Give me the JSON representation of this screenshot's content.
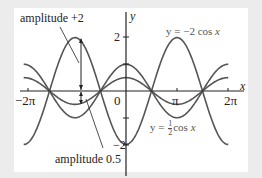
{
  "chart_data": {
    "type": "line",
    "title": "",
    "xlabel": "x",
    "ylabel": "y",
    "xlim": [
      -6.6,
      6.8
    ],
    "ylim": [
      -2.6,
      3.0
    ],
    "x_ticks": [
      "-2π",
      "0",
      "π",
      "2π"
    ],
    "y_ticks": [
      "2",
      "-2"
    ],
    "grid": false,
    "series": [
      {
        "name": "y = -2 cos x",
        "function": "-2*cos(x)",
        "amplitude": 2,
        "domain": [
          -6.3,
          6.3
        ]
      },
      {
        "name": "y = cos x",
        "function": "cos(x)",
        "amplitude": 1,
        "domain": [
          -6.3,
          6.3
        ]
      },
      {
        "name": "y = 1/2 cos x",
        "function": "0.5*cos(x)",
        "amplitude": 0.5,
        "domain": [
          -6.3,
          6.3
        ]
      }
    ],
    "annotations": [
      {
        "text": "amplitude +2",
        "points_to": {
          "x": -3.1416,
          "y_range": [
            0,
            2
          ]
        }
      },
      {
        "text": "amplitude 0.5",
        "points_to": {
          "x": -3.1416,
          "y_range": [
            -0.5,
            0
          ]
        }
      },
      {
        "text": "y = −2 cos x",
        "label_for": "y = -2 cos x"
      },
      {
        "text": "y = ½ cos x",
        "label_for": "y = 1/2 cos x"
      }
    ]
  },
  "labels": {
    "axis_y": "y",
    "axis_x": "x",
    "tick_2": "2",
    "tick_neg2": "−2",
    "tick_neg2pi": "−2π",
    "tick_0": "0",
    "tick_pi": "π",
    "tick_2pi": "2π",
    "ann_amp2": "amplitude +2",
    "ann_amp05": "amplitude 0.5",
    "curve_neg2cos_prefix": "y = −2 cos ",
    "curve_neg2cos_var": "x",
    "curve_half_prefix": "y = ",
    "curve_half_num": "1",
    "curve_half_den": "2",
    "curve_half_suffix": "cos ",
    "curve_half_var": "x"
  },
  "colors": {
    "curve": "#555555",
    "axis": "#222222",
    "panel": "#ffffff",
    "background": "#ececec"
  }
}
